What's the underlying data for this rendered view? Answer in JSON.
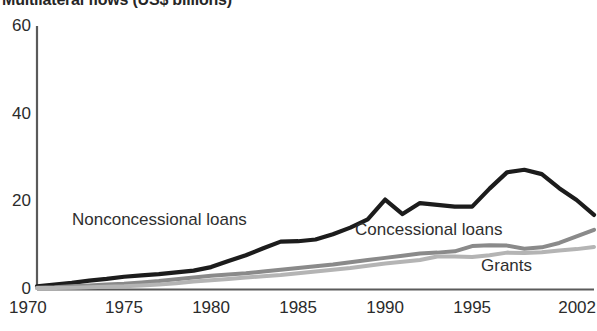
{
  "chart_data": {
    "type": "line",
    "title": "Multilateral flows (US$ billions)",
    "xlabel": "",
    "ylabel": "",
    "xlim": [
      1970,
      2002
    ],
    "ylim": [
      0,
      60
    ],
    "grid": false,
    "legend_position": "inline-annotations",
    "x_tick_labels": [
      "1970",
      "1975",
      "1980",
      "1985",
      "1990",
      "1995",
      "2002"
    ],
    "x_ticks": [
      1970,
      1975,
      1980,
      1985,
      1990,
      1995,
      2002
    ],
    "y_tick_labels": [
      "0",
      "20",
      "40",
      "60"
    ],
    "y_ticks": [
      0,
      20,
      40,
      60
    ],
    "x": [
      1970,
      1971,
      1972,
      1973,
      1974,
      1975,
      1976,
      1977,
      1978,
      1979,
      1980,
      1981,
      1982,
      1983,
      1984,
      1985,
      1986,
      1987,
      1988,
      1989,
      1990,
      1991,
      1992,
      1993,
      1994,
      1995,
      1996,
      1997,
      1998,
      1999,
      2000,
      2001,
      2002
    ],
    "series": [
      {
        "name": "Nonconcessional loans",
        "color": "#1c1c1c",
        "values": [
          0.6,
          1.0,
          1.4,
          1.9,
          2.3,
          2.8,
          3.1,
          3.4,
          3.8,
          4.2,
          5.0,
          6.4,
          7.7,
          9.3,
          10.8,
          10.9,
          11.3,
          12.5,
          14.0,
          15.9,
          20.4,
          17.1,
          19.6,
          19.2,
          18.8,
          18.8,
          22.9,
          26.6,
          27.2,
          26.2,
          23.0,
          20.3,
          16.9
        ]
      },
      {
        "name": "Concessional loans",
        "color": "#8a8a8a",
        "values": [
          0.3,
          0.4,
          0.6,
          0.8,
          1.0,
          1.2,
          1.5,
          1.8,
          2.2,
          2.6,
          3.0,
          3.3,
          3.6,
          4.0,
          4.4,
          4.8,
          5.2,
          5.6,
          6.1,
          6.6,
          7.1,
          7.6,
          8.1,
          8.3,
          8.6,
          9.8,
          10.0,
          9.9,
          9.2,
          9.5,
          10.5,
          12.0,
          13.5
        ]
      },
      {
        "name": "Grants",
        "color": "#b4b4b4",
        "values": [
          0.2,
          0.25,
          0.3,
          0.4,
          0.5,
          0.6,
          0.8,
          1.0,
          1.3,
          1.7,
          2.0,
          2.3,
          2.6,
          2.9,
          3.2,
          3.6,
          4.0,
          4.4,
          4.8,
          5.3,
          5.8,
          6.2,
          6.6,
          7.4,
          7.4,
          7.3,
          7.7,
          8.3,
          8.2,
          8.4,
          8.8,
          9.1,
          9.6
        ]
      }
    ],
    "annotations": [
      {
        "text": "Nonconcessional loans",
        "x_px": 72,
        "y_px": 211
      },
      {
        "text": "Concessional loans",
        "x_px": 355,
        "y_px": 221
      },
      {
        "text": "Grants",
        "x_px": 481,
        "y_px": 257
      }
    ]
  },
  "axis": {
    "color": "#5a5a5a"
  }
}
